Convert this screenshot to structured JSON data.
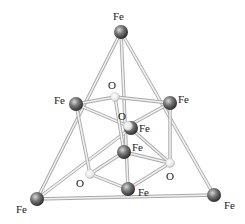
{
  "diagram": {
    "type": "molecular-structure",
    "colors": {
      "bond": "#d8d8d8",
      "bond_edge": "#a8a8a8",
      "fe_atom": "#6e6e6e",
      "o_atom": "#f2f2f2",
      "label": "#222222"
    },
    "atoms": [
      {
        "id": "fe_top",
        "element": "Fe",
        "label": "Fe",
        "x": 121,
        "y": 32,
        "lx": 113,
        "ly": 20
      },
      {
        "id": "fe_left",
        "element": "Fe",
        "label": "Fe",
        "x": 76,
        "y": 104,
        "lx": 54,
        "ly": 104
      },
      {
        "id": "fe_right",
        "element": "Fe",
        "label": "Fe",
        "x": 170,
        "y": 103,
        "lx": 178,
        "ly": 103
      },
      {
        "id": "fe_center",
        "element": "Fe",
        "label": "Fe",
        "x": 131,
        "y": 128,
        "lx": 139,
        "ly": 132
      },
      {
        "id": "fe_inner",
        "element": "Fe",
        "label": "Fe",
        "x": 124,
        "y": 152,
        "lx": 132,
        "ly": 151
      },
      {
        "id": "fe_bottom_mid",
        "element": "Fe",
        "label": "Fe",
        "x": 128,
        "y": 189,
        "lx": 138,
        "ly": 196
      },
      {
        "id": "fe_bottom_left",
        "element": "Fe",
        "label": "Fe",
        "x": 37,
        "y": 199,
        "lx": 16,
        "ly": 213
      },
      {
        "id": "fe_bottom_right",
        "element": "Fe",
        "label": "Fe",
        "x": 214,
        "y": 195,
        "lx": 224,
        "ly": 209
      },
      {
        "id": "o_top",
        "element": "O",
        "label": "O",
        "x": 115,
        "y": 97,
        "lx": 108,
        "ly": 89
      },
      {
        "id": "o_mid",
        "element": "O",
        "label": "O",
        "x": 128,
        "y": 126,
        "lx": 118,
        "ly": 120
      },
      {
        "id": "o_left",
        "element": "O",
        "label": "O",
        "x": 90,
        "y": 174,
        "lx": 76,
        "ly": 187
      },
      {
        "id": "o_right",
        "element": "O",
        "label": "O",
        "x": 170,
        "y": 163,
        "lx": 166,
        "ly": 180
      }
    ],
    "bonds": [
      [
        "fe_top",
        "fe_bottom_left"
      ],
      [
        "fe_top",
        "fe_bottom_right"
      ],
      [
        "fe_top",
        "fe_bottom_mid"
      ],
      [
        "fe_bottom_left",
        "fe_bottom_right"
      ],
      [
        "fe_bottom_left",
        "fe_center"
      ],
      [
        "fe_left",
        "o_top"
      ],
      [
        "o_top",
        "fe_right"
      ],
      [
        "fe_left",
        "o_mid"
      ],
      [
        "o_mid",
        "fe_right"
      ],
      [
        "o_top",
        "fe_inner"
      ],
      [
        "fe_left",
        "o_left"
      ],
      [
        "fe_right",
        "o_right"
      ],
      [
        "o_left",
        "fe_bottom_mid"
      ],
      [
        "fe_bottom_mid",
        "o_right"
      ],
      [
        "o_left",
        "fe_inner"
      ],
      [
        "fe_inner",
        "o_right"
      ],
      [
        "o_mid",
        "o_right"
      ]
    ]
  }
}
